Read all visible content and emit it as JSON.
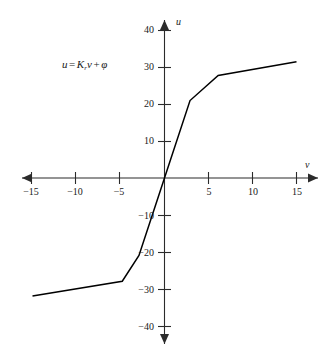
{
  "figure": {
    "background_color": "#ffffff",
    "line_color": "#000000",
    "axis_color": "#2b2b2b"
  },
  "annotation": {
    "equation_full": "u = Kᵣv + φ",
    "lhs": "u",
    "equals": "=",
    "gain_symbol": "K",
    "gain_subscript": "r",
    "variable": "v",
    "plus": "+",
    "offset_symbol": "φ"
  },
  "axes": {
    "x_name": "v",
    "y_name": "u",
    "x_tick_labels": [
      "−15",
      "−10",
      "−5",
      "5",
      "10",
      "15"
    ],
    "y_tick_labels": [
      "40",
      "30",
      "20",
      "10",
      "−10",
      "−20",
      "−30",
      "−40"
    ]
  },
  "chart_data": {
    "type": "line",
    "title": "",
    "subtitle": "",
    "xlabel": "v",
    "ylabel": "u",
    "xlim": [
      -15,
      15
    ],
    "ylim": [
      -40,
      40
    ],
    "xticks": [
      -15,
      -10,
      -5,
      5,
      10,
      15
    ],
    "yticks": [
      40,
      30,
      20,
      10,
      -10,
      -20,
      -30,
      -40
    ],
    "grid": false,
    "legend": null,
    "annotations": [
      {
        "text": "u = Kᵣv + φ",
        "x": -10.7,
        "y": 32
      }
    ],
    "series": [
      {
        "name": "u = Kᵣv + φ",
        "x": [
          -15,
          -4.8,
          -2.9,
          0,
          2.9,
          6.1,
          15
        ],
        "y": [
          -32,
          -28,
          -21,
          0,
          21,
          27.8,
          31.5
        ]
      }
    ]
  }
}
